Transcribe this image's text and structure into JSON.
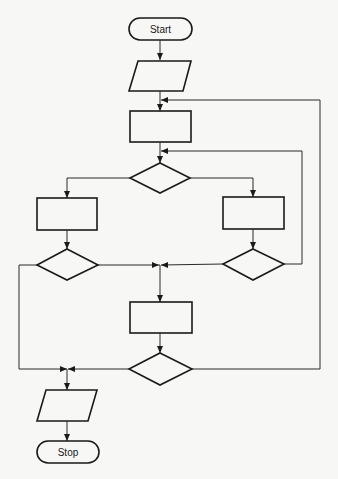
{
  "diagram": {
    "type": "flowchart",
    "background": "#f7f7f5",
    "stroke_color": "#1a1a1a",
    "nodes": [
      {
        "id": "start",
        "kind": "terminal",
        "label": "Start"
      },
      {
        "id": "input",
        "kind": "input-output",
        "label": ""
      },
      {
        "id": "process-1",
        "kind": "process",
        "label": ""
      },
      {
        "id": "decision-1",
        "kind": "decision",
        "label": ""
      },
      {
        "id": "process-left",
        "kind": "process",
        "label": ""
      },
      {
        "id": "process-right",
        "kind": "process",
        "label": ""
      },
      {
        "id": "decision-left",
        "kind": "decision",
        "label": ""
      },
      {
        "id": "decision-right",
        "kind": "decision",
        "label": ""
      },
      {
        "id": "process-2",
        "kind": "process",
        "label": ""
      },
      {
        "id": "decision-2",
        "kind": "decision",
        "label": ""
      },
      {
        "id": "output",
        "kind": "input-output",
        "label": ""
      },
      {
        "id": "stop",
        "kind": "terminal",
        "label": "Stop"
      }
    ],
    "edges": [
      {
        "from": "start",
        "to": "input"
      },
      {
        "from": "input",
        "to": "process-1"
      },
      {
        "from": "process-1",
        "to": "decision-1"
      },
      {
        "from": "decision-1",
        "to": "process-left"
      },
      {
        "from": "decision-1",
        "to": "process-right"
      },
      {
        "from": "process-left",
        "to": "decision-left"
      },
      {
        "from": "process-right",
        "to": "decision-right"
      },
      {
        "from": "decision-left",
        "to": "process-2"
      },
      {
        "from": "decision-right",
        "to": "process-2"
      },
      {
        "from": "decision-right",
        "to": "decision-1",
        "loop": true
      },
      {
        "from": "decision-left",
        "to": "output"
      },
      {
        "from": "process-2",
        "to": "decision-2"
      },
      {
        "from": "decision-2",
        "to": "output"
      },
      {
        "from": "decision-2",
        "to": "process-1",
        "loop": true
      },
      {
        "from": "output",
        "to": "stop"
      }
    ]
  },
  "labels": {
    "start": "Start",
    "stop": "Stop"
  }
}
